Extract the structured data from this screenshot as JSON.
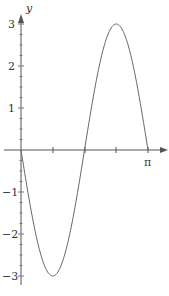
{
  "chart_data": {
    "type": "line",
    "title": "",
    "xlabel": "",
    "ylabel": "y",
    "function": "-3 sin(2x)",
    "xlim": [
      0,
      3.14159
    ],
    "ylim": [
      -3,
      3
    ],
    "x_tick_labels": [
      "π"
    ],
    "y_tick_labels": [
      "3",
      "2",
      "1",
      "-1",
      "-2",
      "-3"
    ],
    "x": [
      0,
      0.3927,
      0.7854,
      1.1781,
      1.5708,
      1.9635,
      2.3562,
      2.7489,
      3.1416
    ],
    "values": [
      0,
      -2.121,
      -3,
      -2.121,
      0,
      2.121,
      3,
      2.121,
      0
    ],
    "grid": false,
    "colors": {
      "axis": "#555555",
      "curve": "#666666"
    }
  },
  "labels": {
    "y_axis": "y",
    "pi": "π",
    "y3": "3",
    "y2": "2",
    "y1": "1",
    "ym1": "−1",
    "ym2": "−2",
    "ym3": "−3"
  }
}
